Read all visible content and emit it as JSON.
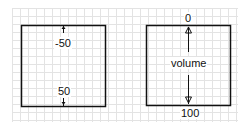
{
  "diagrams": [
    {
      "name": "offset-range",
      "top_label": "-50",
      "bottom_label": "50"
    },
    {
      "name": "volume-range",
      "top_label": "0",
      "center_label": "volume",
      "bottom_label": "100"
    }
  ],
  "colors": {
    "stroke": "#111111",
    "grid": "#e3e3e3"
  }
}
